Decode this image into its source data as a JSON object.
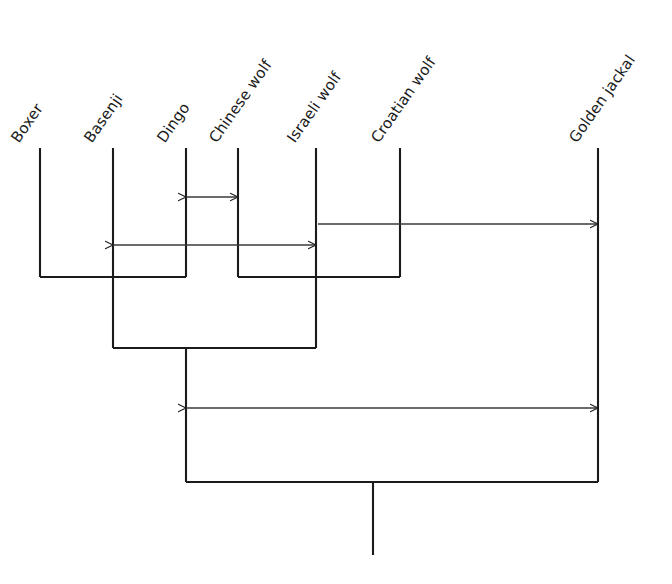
{
  "figure": {
    "type": "phylogenetic-tree",
    "title": "",
    "background_color": "#ffffff",
    "line_color": "#1b1b1b",
    "text_color": "#1b1b1b",
    "width": 672,
    "height": 584,
    "label_rotation_deg": -55
  },
  "taxa": [
    {
      "id": "boxer",
      "label": "Boxer",
      "x": 40,
      "tip_y": 148,
      "label_x": 22,
      "label_y": 146
    },
    {
      "id": "basenji",
      "label": "Basenji",
      "x": 113,
      "tip_y": 148,
      "label_x": 95,
      "label_y": 146
    },
    {
      "id": "dingo",
      "label": "Dingo",
      "x": 186,
      "tip_y": 148,
      "label_x": 168,
      "label_y": 146
    },
    {
      "id": "chinese_wolf",
      "label": "Chinese wolf",
      "x": 238,
      "tip_y": 148,
      "label_x": 220,
      "label_y": 146
    },
    {
      "id": "israeli_wolf",
      "label": "Israeli wolf",
      "x": 316,
      "tip_y": 148,
      "label_x": 298,
      "label_y": 146
    },
    {
      "id": "croatian_wolf",
      "label": "Croatian wolf",
      "x": 400,
      "tip_y": 148,
      "label_x": 382,
      "label_y": 146
    },
    {
      "id": "golden_jackal",
      "label": "Golden jackal",
      "x": 598,
      "tip_y": 148,
      "label_x": 580,
      "label_y": 146
    }
  ],
  "nodes": [
    {
      "id": "node-dogs",
      "name": "Boxer + Basenji + Dingo clade",
      "bar_y": 277,
      "bar_x1": 40,
      "bar_x2": 186,
      "stem_x": 113,
      "stem_y2": 348
    },
    {
      "id": "node-wolves",
      "name": "Chinese + Israeli + Croatian wolf clade",
      "bar_y": 277,
      "bar_x1": 238,
      "bar_x2": 400,
      "stem_x": 316,
      "stem_y2": 348
    },
    {
      "id": "node-dog-wolf",
      "name": "Dog and wolf common ancestor",
      "bar_y": 348,
      "bar_x1": 113,
      "bar_x2": 316,
      "stem_x": 186,
      "stem_y2": 482
    },
    {
      "id": "node-root",
      "name": "Root node with Golden jackal outgroup",
      "bar_y": 482,
      "bar_x1": 186,
      "bar_x2": 598,
      "stem_x": 373,
      "stem_y2": 555
    }
  ],
  "tip_branches": [
    {
      "taxon": "boxer",
      "x": 40,
      "y1": 148,
      "y2": 277
    },
    {
      "taxon": "basenji",
      "x": 113,
      "y1": 148,
      "y2": 277
    },
    {
      "taxon": "dingo",
      "x": 186,
      "y1": 148,
      "y2": 277
    },
    {
      "taxon": "chinese_wolf",
      "x": 238,
      "y1": 148,
      "y2": 277
    },
    {
      "taxon": "israeli_wolf",
      "x": 316,
      "y1": 148,
      "y2": 277
    },
    {
      "taxon": "croatian_wolf",
      "x": 400,
      "y1": 148,
      "y2": 277
    },
    {
      "taxon": "golden_jackal",
      "x": 598,
      "y1": 148,
      "y2": 482
    }
  ],
  "comparison_arrows": [
    {
      "id": "arrow-dingo-chinesewolf",
      "name": "Dingo to Chinese wolf distance",
      "x1": 186,
      "x2": 238,
      "y": 197,
      "head_left": true,
      "head_right": true
    },
    {
      "id": "arrow-basenji-israeli",
      "name": "Basenji to Israeli wolf distance",
      "x1": 113,
      "x2": 316,
      "y": 245,
      "head_left": true,
      "head_right": true
    },
    {
      "id": "arrow-israeli-jackal",
      "name": "Israeli wolf to Golden jackal distance",
      "x1": 318,
      "x2": 598,
      "y": 224,
      "head_left": false,
      "head_right": true
    },
    {
      "id": "arrow-clade-jackal",
      "name": "Dog-wolf clade to Golden jackal distance",
      "x1": 186,
      "x2": 598,
      "y": 408,
      "head_left": true,
      "head_right": true
    }
  ]
}
